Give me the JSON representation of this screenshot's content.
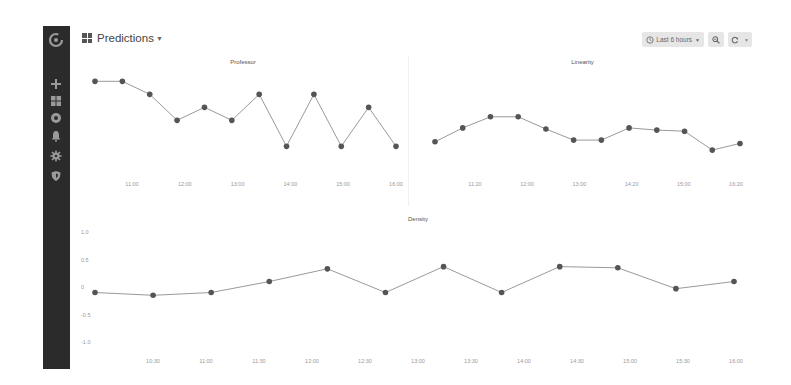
{
  "sidebar": {
    "items": [
      {
        "name": "logo",
        "icon": "grafana-logo-icon"
      },
      {
        "name": "create",
        "icon": "plus-icon"
      },
      {
        "name": "dashboards",
        "icon": "dashboards-icon"
      },
      {
        "name": "explore",
        "icon": "compass-icon"
      },
      {
        "name": "alerting",
        "icon": "bell-icon"
      },
      {
        "name": "configuration",
        "icon": "gear-icon"
      },
      {
        "name": "server-admin",
        "icon": "shield-icon"
      }
    ]
  },
  "header": {
    "title": "Predictions",
    "time_range_label": "Last 6 hours",
    "zoom_out_icon": "zoom-out-icon",
    "refresh_icon": "refresh-icon",
    "refresh_dropdown_icon": "chevron-down-icon"
  },
  "colors": {
    "sidebar_bg": "#2b2b2b",
    "series_point": "#555555",
    "series_line": "#9a9a9a",
    "button_bg": "#e6e6e6"
  },
  "chart_data": [
    {
      "type": "line",
      "title": "Professor",
      "x": [
        "10:40",
        "11:00",
        "11:20",
        "11:40",
        "12:00",
        "12:20",
        "12:40",
        "13:00",
        "13:20",
        "13:40",
        "14:00",
        "14:20"
      ],
      "x_tick_labels": [
        "11:00",
        "12:00",
        "13:00",
        "14:00",
        "15:00",
        "16:00"
      ],
      "values": [
        0.8,
        0.8,
        0.65,
        0.35,
        0.5,
        0.35,
        0.65,
        0.05,
        0.65,
        0.05,
        0.5,
        0.05
      ],
      "xlabel": "",
      "ylabel": "",
      "ylim": [
        -0.5,
        1.0
      ],
      "grid": false,
      "legend": "none",
      "markers": true
    },
    {
      "type": "line",
      "title": "Linearity",
      "x_tick_labels": [
        "11:20",
        "12:00",
        "13:00",
        "14:20",
        "15:00",
        "16:20"
      ],
      "values": [
        0.05,
        0.3,
        0.5,
        0.5,
        0.28,
        0.08,
        0.08,
        0.3,
        0.26,
        0.24,
        -0.1,
        0.02
      ],
      "xlabel": "",
      "ylabel": "",
      "ylim": [
        -0.8,
        1.0
      ],
      "grid": false,
      "legend": "none",
      "markers": true
    },
    {
      "type": "line",
      "title": "Density",
      "x_tick_labels": [
        "10:30",
        "11:00",
        "11:30",
        "12:00",
        "12:30",
        "13:00",
        "13:30",
        "14:00",
        "14:30",
        "15:00",
        "15:30",
        "16:00"
      ],
      "y_tick_labels": [
        "1.0",
        "0.5",
        "0",
        "-0.5",
        "-1.0"
      ],
      "values": [
        -0.1,
        -0.15,
        -0.1,
        0.1,
        0.33,
        -0.1,
        0.37,
        -0.1,
        0.37,
        0.35,
        -0.03,
        0.1
      ],
      "xlabel": "",
      "ylabel": "",
      "ylim": [
        -1.0,
        1.0
      ],
      "grid": false,
      "legend": "none",
      "markers": true
    }
  ]
}
